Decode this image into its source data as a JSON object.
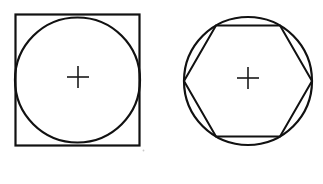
{
  "canvas": {
    "width": 323,
    "height": 184,
    "background_color": "#ffffff",
    "stroke_color": "#111111",
    "cross_color": "#1a1a1a",
    "speck_color": "#c9c9c9"
  },
  "figures": [
    {
      "id": "circle-inscribed-in-square",
      "label": "Circle inscribed in a square",
      "shapes": {
        "square": {
          "name": "outer-square",
          "x": 15.5,
          "y": 14.5,
          "width": 124,
          "height": 131,
          "stroke_width": 2.2
        },
        "circle": {
          "name": "inscribed-circle",
          "cx": 77.5,
          "cy": 80,
          "r": 62.5,
          "stroke_width": 2.2
        },
        "center_mark": {
          "name": "center-cross",
          "cx": 78,
          "cy": 77,
          "arm": 11,
          "stroke_width": 1.6
        }
      }
    },
    {
      "id": "hexagon-inscribed-in-circle",
      "label": "Regular hexagon inscribed in a circle",
      "shapes": {
        "circle": {
          "name": "outer-circle",
          "cx": 248,
          "cy": 81,
          "r": 64,
          "stroke_width": 2.2
        },
        "hexagon": {
          "name": "inscribed-hexagon",
          "points": "184,81 216,25.6 280,25.6 312,81 280,136.4 216,136.4",
          "stroke_width": 2.0
        },
        "center_mark": {
          "name": "center-cross",
          "cx": 248,
          "cy": 78,
          "arm": 11,
          "stroke_width": 1.6
        }
      }
    }
  ],
  "artifacts": [
    {
      "name": "scan-speck",
      "cx": 143.5,
      "cy": 150.5,
      "r": 0.9
    }
  ]
}
